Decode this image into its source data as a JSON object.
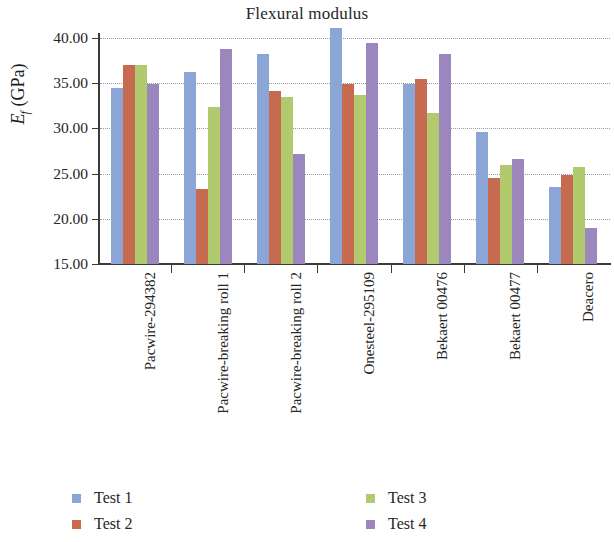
{
  "chart_data": {
    "type": "bar",
    "title": "Flexural modulus",
    "xlabel": "",
    "ylabel": "E_f (GPa)",
    "ylabel_parts": {
      "symbol": "E",
      "subscript": "f",
      "unit": "(GPa)"
    },
    "ylim": [
      15.0,
      40.0
    ],
    "ytick_labels": [
      "40.00",
      "35.00",
      "30.00",
      "25.00",
      "20.00",
      "15.00"
    ],
    "ytick_values": [
      40.0,
      35.0,
      30.0,
      25.0,
      20.0,
      15.0
    ],
    "grid": true,
    "grid_style": "dotted",
    "legend_position": "bottom",
    "categories": [
      "Pacwire-294382",
      "Pacwire-breaking roll 1",
      "Pacwire-breaking roll 2",
      "Onesteel-295109",
      "Bekaert 00476",
      "Bekaert 00477",
      "Deacero"
    ],
    "series": [
      {
        "name": "Test 1",
        "color": "#8ba6d6",
        "values": [
          34.5,
          36.2,
          38.2,
          41.1,
          34.9,
          29.6,
          23.5
        ]
      },
      {
        "name": "Test 2",
        "color": "#c66b4f",
        "values": [
          37.0,
          23.3,
          34.1,
          34.9,
          35.5,
          24.5,
          24.9
        ]
      },
      {
        "name": "Test 3",
        "color": "#b0ca6d",
        "values": [
          37.0,
          32.4,
          33.5,
          33.7,
          31.7,
          25.9,
          25.7
        ]
      },
      {
        "name": "Test 4",
        "color": "#9b86bd",
        "values": [
          34.9,
          38.8,
          27.2,
          39.5,
          38.2,
          26.6,
          19.0
        ]
      }
    ]
  },
  "legend": {
    "items": [
      {
        "label": "Test 1"
      },
      {
        "label": "Test 2"
      },
      {
        "label": "Test 3"
      },
      {
        "label": "Test 4"
      }
    ]
  }
}
